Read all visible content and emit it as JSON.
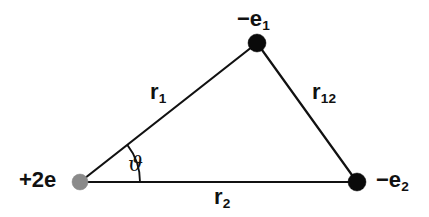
{
  "figure": {
    "type": "geometry-diagram",
    "background_color": "#ffffff",
    "line_color": "#111111",
    "nucleus_color": "#8a8a8a",
    "electron_color": "#0a0a0a"
  },
  "particles": {
    "nucleus": {
      "label": "+2e",
      "icon": "filled-circle-gray",
      "x": 80,
      "y": 182,
      "radius": 8
    },
    "electron1": {
      "label": "−e",
      "subscript": "1",
      "icon": "filled-circle-black",
      "x": 257,
      "y": 43,
      "radius": 9
    },
    "electron2": {
      "label": "−e",
      "subscript": "2",
      "icon": "filled-circle-black",
      "x": 357,
      "y": 182,
      "radius": 9
    }
  },
  "edges": {
    "r1": {
      "label": "r",
      "subscript": "1",
      "from": "nucleus",
      "to": "electron1"
    },
    "r2": {
      "label": "r",
      "subscript": "2",
      "from": "nucleus",
      "to": "electron2"
    },
    "r12": {
      "label": "r",
      "subscript": "12",
      "from": "electron1",
      "to": "electron2"
    }
  },
  "angle": {
    "label": "ϑ",
    "icon": "arc-sweep",
    "vertex": "nucleus",
    "radius": 60,
    "degrees": 38
  }
}
